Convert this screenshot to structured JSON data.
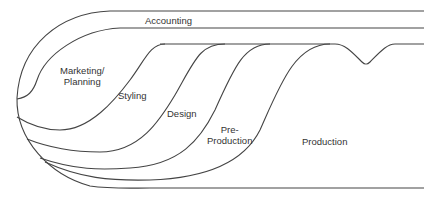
{
  "diagram": {
    "type": "flow-stage-diagram",
    "colors": {
      "line": "#444444",
      "text": "#333333",
      "background": "#ffffff"
    },
    "regions": [
      {
        "id": "accounting",
        "label": "Accounting"
      },
      {
        "id": "marketing-planning",
        "label_line1": "Marketing/",
        "label_line2": "Planning"
      },
      {
        "id": "styling",
        "label": "Styling"
      },
      {
        "id": "design",
        "label": "Design"
      },
      {
        "id": "pre-production",
        "label_line1": "Pre-",
        "label_line2": "Production"
      },
      {
        "id": "production",
        "label": "Production"
      }
    ]
  }
}
